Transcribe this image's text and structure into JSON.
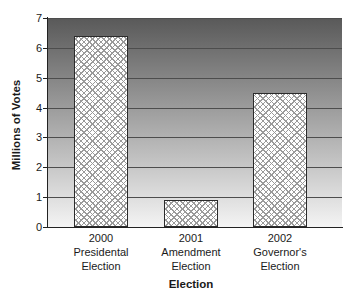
{
  "chart_data": {
    "type": "bar",
    "categories": [
      "2000\nPresidental\nElection",
      "2001\nAmendment\nElection",
      "2002\nGovernor's\nElection"
    ],
    "values": [
      6.4,
      0.9,
      4.5
    ],
    "title": "",
    "xlabel": "Election",
    "ylabel": "Millions of Votes",
    "ylim": [
      0,
      7
    ],
    "yticks": [
      0,
      1,
      2,
      3,
      4,
      5,
      6,
      7
    ],
    "grid": true,
    "legend": false,
    "bar_pattern": "crosshatch",
    "plot_background": "vertical gradient, dark gray at top to near-white at bottom"
  },
  "colors": {
    "page_bg": "#ffffff",
    "plot_bg_top": "#595959",
    "plot_bg_bottom": "#f4f4f4",
    "gridline": "#4d4d4d",
    "axis": "#222222",
    "bar_fill": "#ffffff",
    "bar_hatch": "#9a9a9a",
    "bar_border": "#2b2b2b",
    "text": "#1a1a1a"
  }
}
